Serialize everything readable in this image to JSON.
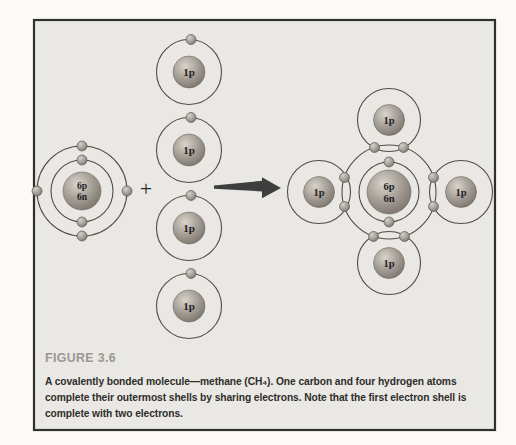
{
  "figure": {
    "heading": "FIGURE 3.6",
    "caption_lines": [
      "A covalently bonded molecule—methane (CH₄). One carbon and four hydrogen atoms",
      "complete their outermost shells by sharing electrons. Note that the first electron shell is",
      "complete with two electrons."
    ]
  },
  "diagram": {
    "plus_sign": "+",
    "carbon_nucleus": {
      "protons": "6p",
      "neutrons": "6n"
    },
    "hydrogen_nucleus": "1p"
  },
  "colors": {
    "page_background": "#fbfaf8",
    "box_background": "#eae8e4",
    "box_border": "#303030",
    "orbit_stroke": "#524d47",
    "nucleus_gray": "#a59f97",
    "arrow": "#3e3e3e",
    "heading_gray": "#9a9792",
    "caption_text": "#2f2d2a"
  }
}
